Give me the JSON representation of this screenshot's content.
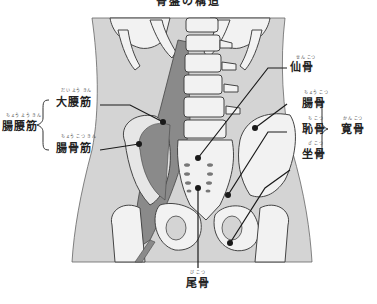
{
  "title": "骨盤の構造",
  "labels": {
    "psoas_major": {
      "text": "大腰筋",
      "ruby": "だい よう きん"
    },
    "iliopsoas": {
      "text": "腸腰筋",
      "ruby": "ちょう よう きん"
    },
    "iliacus": {
      "text": "腸骨筋",
      "ruby": "ちょう こつ きん"
    },
    "sacrum": {
      "text": "仙骨",
      "ruby": "せん こつ"
    },
    "ilium": {
      "text": "腸骨",
      "ruby": "ちょう こつ"
    },
    "pubis": {
      "text": "恥骨",
      "ruby": "ち こつ"
    },
    "ischium": {
      "text": "坐骨",
      "ruby": "ざ こつ"
    },
    "hip_bone": {
      "text": "寛骨",
      "ruby": "かん こつ"
    },
    "coccyx": {
      "text": "尾骨",
      "ruby": "び こつ"
    }
  },
  "colors": {
    "body": "#d4d4d4",
    "bone": "#f2f2f2",
    "muscle": "#8a8a8a",
    "line": "#1a1a1a"
  }
}
